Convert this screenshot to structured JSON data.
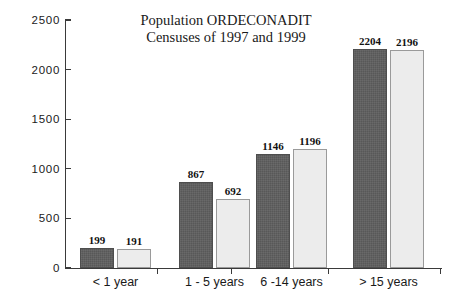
{
  "chart_data": {
    "type": "bar",
    "title": "Population ORDECONADIT",
    "subtitle": "Censuses of 1997 and 1999",
    "title_lines": [
      "Population ORDECONADIT",
      "Censuses of 1997 and 1999"
    ],
    "xlabel": "",
    "ylabel": "",
    "ylim": [
      0,
      2500
    ],
    "ytick_labels": [
      "0",
      "500",
      "1000",
      "1500",
      "2000",
      "2500"
    ],
    "yticks": [
      0,
      500,
      1000,
      1500,
      2000,
      2500
    ],
    "grid": false,
    "legend": "none",
    "categories": [
      "< 1 year",
      "1 - 5 years",
      "6 -14 years",
      "> 15 years"
    ],
    "series": [
      {
        "name": "Census 1997",
        "color": "#585858",
        "values": [
          199,
          867,
          1146,
          2204
        ],
        "value_labels": [
          "199",
          "867",
          "1146",
          "2204"
        ]
      },
      {
        "name": "Census 1999",
        "color": "#ececec",
        "values": [
          191,
          692,
          1196,
          2196
        ],
        "value_labels": [
          "191",
          "692",
          "1196",
          "2196"
        ]
      }
    ]
  },
  "colors": {
    "dark_bar": "#585858",
    "light_bar": "#ececec",
    "light_bar_border": "#9a9a9a",
    "axis": "#3a3a3a",
    "text": "#1a1a1a",
    "background": "#ffffff"
  }
}
